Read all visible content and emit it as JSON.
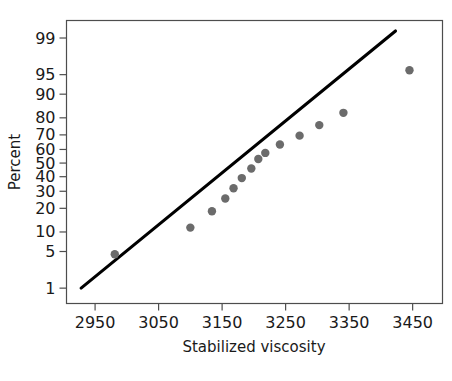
{
  "chart_data": {
    "type": "scatter",
    "title": "",
    "subtitle": "",
    "xlabel": "Stabilized viscosity",
    "ylabel": "Percent",
    "xlim": [
      2905,
      3497
    ],
    "ylim_percent": [
      0.45,
      99.6
    ],
    "x_ticks": [
      2950,
      3050,
      3150,
      3250,
      3350,
      3450
    ],
    "x_tick_labels": [
      "2950",
      "3050",
      "3150",
      "3250",
      "3350",
      "3450"
    ],
    "y_ticks": [
      1,
      5,
      10,
      20,
      30,
      40,
      50,
      60,
      70,
      80,
      90,
      95,
      99
    ],
    "y_tick_labels": [
      "1",
      "5",
      "10",
      "20",
      "30",
      "40",
      "50",
      "60",
      "70",
      "80",
      "90",
      "95",
      "99"
    ],
    "y_scale": "normal probability",
    "grid": false,
    "legend": null,
    "series": [
      {
        "name": "Stabilized viscosity",
        "marker": "filled-circle",
        "color": "#6b6b6b",
        "points": [
          {
            "x": 2981,
            "percent": 4.5
          },
          {
            "x": 3100,
            "percent": 11.5
          },
          {
            "x": 3134,
            "percent": 18.5
          },
          {
            "x": 3155,
            "percent": 25.5
          },
          {
            "x": 3168,
            "percent": 32.0
          },
          {
            "x": 3181,
            "percent": 39.0
          },
          {
            "x": 3196,
            "percent": 46.0
          },
          {
            "x": 3207,
            "percent": 53.0
          },
          {
            "x": 3218,
            "percent": 57.5
          },
          {
            "x": 3341,
            "percent": 82.5
          },
          {
            "x": 3241,
            "percent": 63.5
          },
          {
            "x": 3272,
            "percent": 69.5
          },
          {
            "x": 3303,
            "percent": 76.0
          },
          {
            "x": 3445,
            "percent": 95.8
          }
        ]
      }
    ],
    "fit_line": {
      "name": "normal distribution fit",
      "color": "#000000",
      "endpoints": [
        {
          "x": 2928,
          "percent": 1.0
        },
        {
          "x": 3423,
          "percent": 99.3
        }
      ]
    }
  }
}
